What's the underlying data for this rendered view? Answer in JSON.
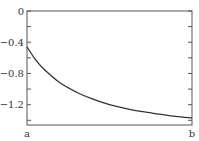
{
  "chart_data": {
    "type": "line",
    "title": "",
    "xlabel": "",
    "ylabel": "",
    "x_tick_labels": [
      "a",
      "b"
    ],
    "y_tick_labels": [
      "0",
      "-0.4",
      "-0.8",
      "-1.2"
    ],
    "y_ticks": [
      0,
      -0.4,
      -0.8,
      -1.2
    ],
    "y_minor_ticks": [
      -0.2,
      -0.6,
      -1.0,
      -1.4
    ],
    "ylim": [
      -1.46,
      0
    ],
    "xlim": [
      0,
      1
    ],
    "grid": false,
    "legend": null,
    "series": [
      {
        "name": "curve",
        "color": "#333333",
        "x": [
          0,
          0.05,
          0.1,
          0.2,
          0.3,
          0.4,
          0.5,
          0.6,
          0.7,
          0.8,
          0.9,
          1.0
        ],
        "y": [
          -0.46,
          -0.62,
          -0.74,
          -0.92,
          -1.04,
          -1.13,
          -1.2,
          -1.25,
          -1.29,
          -1.32,
          -1.35,
          -1.37
        ]
      }
    ]
  },
  "colors": {
    "axis": "#555555",
    "line": "#333333",
    "text": "#333333"
  }
}
